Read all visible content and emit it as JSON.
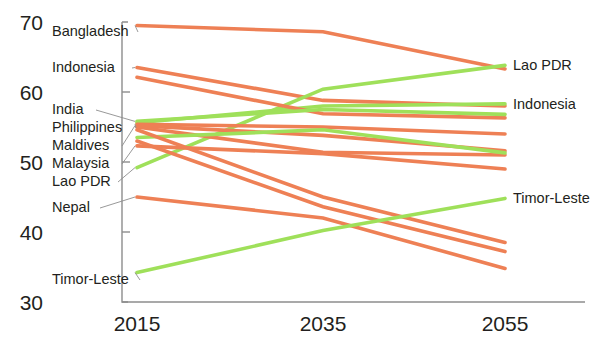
{
  "chart_data": {
    "type": "line",
    "title": "",
    "xlabel": "",
    "ylabel": "",
    "x": [
      2015,
      2035,
      2055
    ],
    "xlim": [
      2015,
      2055
    ],
    "ylim": [
      30,
      70
    ],
    "yticks": [
      30,
      40,
      50,
      60,
      70
    ],
    "xticks": [
      2015,
      2035,
      2055
    ],
    "grid": false,
    "legend": "inline-labels",
    "colors": {
      "declining": "#ee8055",
      "rising": "#9fe05a",
      "axis": "#8d8d8d",
      "text": "#231f20",
      "background": "#ffffff"
    },
    "series": [
      {
        "name": "Bangladesh",
        "color": "declining",
        "values": [
          69.5,
          68.6,
          63.3
        ]
      },
      {
        "name": "Indonesia A",
        "color": "declining",
        "values": [
          63.5,
          58.8,
          58.0
        ]
      },
      {
        "name": "Indonesia",
        "color": "rising",
        "values": [
          55.6,
          58.0,
          58.3
        ]
      },
      {
        "name": "Lao PDR",
        "color": "rising",
        "values": [
          49.2,
          60.4,
          63.8
        ]
      },
      {
        "name": "Series D",
        "color": "declining",
        "values": [
          62.1,
          56.9,
          56.3
        ]
      },
      {
        "name": "India",
        "color": "rising",
        "values": [
          55.8,
          57.5,
          56.8
        ]
      },
      {
        "name": "Philippines",
        "color": "declining",
        "values": [
          55.4,
          55.0,
          54.0
        ]
      },
      {
        "name": "Maldives",
        "color": "declining",
        "values": [
          55.2,
          53.8,
          51.6
        ]
      },
      {
        "name": "Series H",
        "color": "declining",
        "values": [
          55.0,
          51.4,
          51.0
        ]
      },
      {
        "name": "Malaysia",
        "color": "declining",
        "values": [
          52.3,
          51.2,
          49.0
        ]
      },
      {
        "name": "Series J",
        "color": "rising",
        "values": [
          53.5,
          54.6,
          51.3
        ]
      },
      {
        "name": "Series K",
        "color": "declining",
        "values": [
          54.6,
          45.0,
          38.5
        ]
      },
      {
        "name": "Series L",
        "color": "declining",
        "values": [
          53.0,
          43.6,
          37.2
        ]
      },
      {
        "name": "Nepal",
        "color": "declining",
        "values": [
          45.0,
          42.0,
          34.8
        ]
      },
      {
        "name": "Timor-Leste",
        "color": "rising",
        "values": [
          34.2,
          40.2,
          44.8
        ]
      }
    ],
    "left_labels": [
      {
        "text": "Bangladesh",
        "value": 69.5
      },
      {
        "text": "Indonesia",
        "value": 63.5
      },
      {
        "text": "India",
        "value": 55.8
      },
      {
        "text": "Philippines",
        "value": 55.4
      },
      {
        "text": "Maldives",
        "value": 55.2
      },
      {
        "text": "Malaysia",
        "value": 52.3
      },
      {
        "text": "Lao PDR",
        "value": 49.2
      },
      {
        "text": "Nepal",
        "value": 45.0
      },
      {
        "text": "Timor-Leste",
        "value": 34.2
      }
    ],
    "right_labels": [
      {
        "text": "Lao PDR",
        "value": 63.8
      },
      {
        "text": "Indonesia",
        "value": 58.3
      },
      {
        "text": "Timor-Leste",
        "value": 44.8
      }
    ]
  }
}
